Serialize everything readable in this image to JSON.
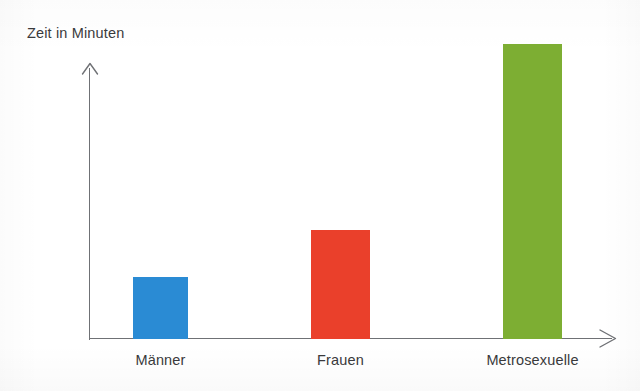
{
  "chart_data": {
    "type": "bar",
    "title": "",
    "subtitle": "",
    "xlabel": "",
    "ylabel": "Zeit in Minuten",
    "categories": [
      "Männer",
      "Frauen",
      "Metrosexuelle"
    ],
    "values": [
      62,
      109,
      295
    ],
    "value_unit": "px-height (unlabeled axis; relative magnitudes)",
    "series": [
      {
        "name": "Zeit in Minuten",
        "values": [
          62,
          109,
          295
        ],
        "colors": [
          "#2a8bd4",
          "#ea402b",
          "#7dae33"
        ]
      }
    ],
    "colors": {
      "maenner": "#2a8bd4",
      "frauen": "#ea402b",
      "metrosexuelle": "#7dae33",
      "axis": "#6f7175",
      "text": "#3a3a3c",
      "background": "#ffffff"
    },
    "ylim": [
      0,
      310
    ],
    "grid": false,
    "legend": false,
    "legend_position": "none",
    "axis_tick_labels": [],
    "annotations": []
  },
  "axes": {
    "y_title": "Zeit in Minuten",
    "y_arrow_icon": "arrow-up-icon",
    "x_arrow_icon": "arrow-right-icon"
  },
  "bars": [
    {
      "label": "Männer",
      "value": 62,
      "color": "#2a8bd4",
      "left": 133,
      "width": 55,
      "height": 62,
      "center": 160.5
    },
    {
      "label": "Frauen",
      "value": 109,
      "color": "#ea402b",
      "left": 311,
      "width": 59,
      "height": 109,
      "center": 340.5
    },
    {
      "label": "Metrosexuelle",
      "value": 295,
      "color": "#7dae33",
      "left": 503,
      "width": 59,
      "height": 295,
      "center": 532.5
    }
  ]
}
